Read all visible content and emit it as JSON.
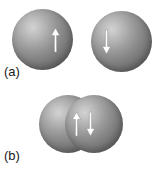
{
  "figure": {
    "width": 161,
    "height": 175,
    "background_color": "#ffffff"
  },
  "colors": {
    "sphere_highlight": "#d2d2d2",
    "sphere_midtone": "#919191",
    "sphere_shadow": "#686868",
    "arrow_fill": "#ffffff",
    "arrow_outline": "#8a8a8a",
    "label_text": "#1a1a1a",
    "background": "#ffffff"
  },
  "panels": [
    {
      "id": "a",
      "label": "(a)",
      "spheres": [
        {
          "id": "sphere-a-left",
          "name": "left-atom",
          "spin": "up",
          "arrow_label": "spin-up-arrow"
        },
        {
          "id": "sphere-a-right",
          "name": "right-atom",
          "spin": "down",
          "arrow_label": "spin-down-arrow"
        }
      ]
    },
    {
      "id": "b",
      "label": "(b)",
      "spheres": [
        {
          "id": "sphere-b-left",
          "name": "left-atom-bonded",
          "spin": "up",
          "arrow_label": "spin-up-arrow"
        },
        {
          "id": "sphere-b-right",
          "name": "right-atom-bonded",
          "spin": "down",
          "arrow_label": "spin-down-arrow"
        }
      ]
    }
  ],
  "labels": {
    "panel_a": "(a)",
    "panel_b": "(b)"
  }
}
